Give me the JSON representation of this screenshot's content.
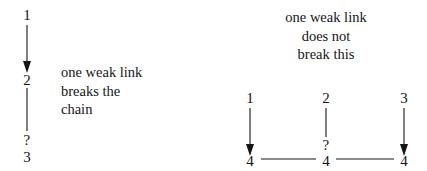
{
  "figure": {
    "background_color": "#ffffff",
    "ink_color": "#151515"
  },
  "left_diagram": {
    "name": "serial-chain",
    "caption": "one weak link\nbreaks the\nchain",
    "nodes": [
      {
        "label": "1",
        "x": 27,
        "y": 15
      },
      {
        "label": "2",
        "x": 27,
        "y": 80
      },
      {
        "label": "?",
        "x": 27,
        "y": 141
      },
      {
        "label": "3",
        "x": 27,
        "y": 158
      }
    ],
    "edges": [
      {
        "from": "1",
        "to": "2",
        "arrowhead": true
      },
      {
        "from": "2",
        "to": "?",
        "arrowhead": false
      }
    ]
  },
  "right_diagram": {
    "name": "parallel-paths",
    "caption": "one weak link\ndoes not\nbreak this",
    "top_nodes": [
      {
        "label": "1",
        "x": 250,
        "y": 99
      },
      {
        "label": "2",
        "x": 326,
        "y": 99
      },
      {
        "label": "3",
        "x": 404,
        "y": 99
      }
    ],
    "bottom_nodes": [
      {
        "label": "4",
        "x": 250,
        "y": 163
      },
      {
        "label": "4",
        "x": 326,
        "y": 163
      },
      {
        "label": "4",
        "x": 404,
        "y": 163
      }
    ],
    "question_node": {
      "label": "?",
      "x": 326,
      "y": 146
    },
    "vertical_edges": [
      {
        "from": "1",
        "to": "4",
        "arrowhead": true
      },
      {
        "from": "2",
        "to": "?",
        "arrowhead": false
      },
      {
        "from": "3",
        "to": "4",
        "arrowhead": true
      }
    ],
    "horizontal_edges": [
      {
        "from": "4",
        "to": "4"
      },
      {
        "from": "4",
        "to": "4"
      }
    ]
  }
}
